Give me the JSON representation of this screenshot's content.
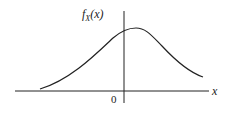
{
  "diagram": {
    "type": "probability-density-curve",
    "y_axis_label": {
      "f": "f",
      "sub": "X",
      "arg": "(x)"
    },
    "x_axis_label": "x",
    "origin_label": "0",
    "colors": {
      "line": "#222222",
      "background": "#ffffff"
    }
  }
}
